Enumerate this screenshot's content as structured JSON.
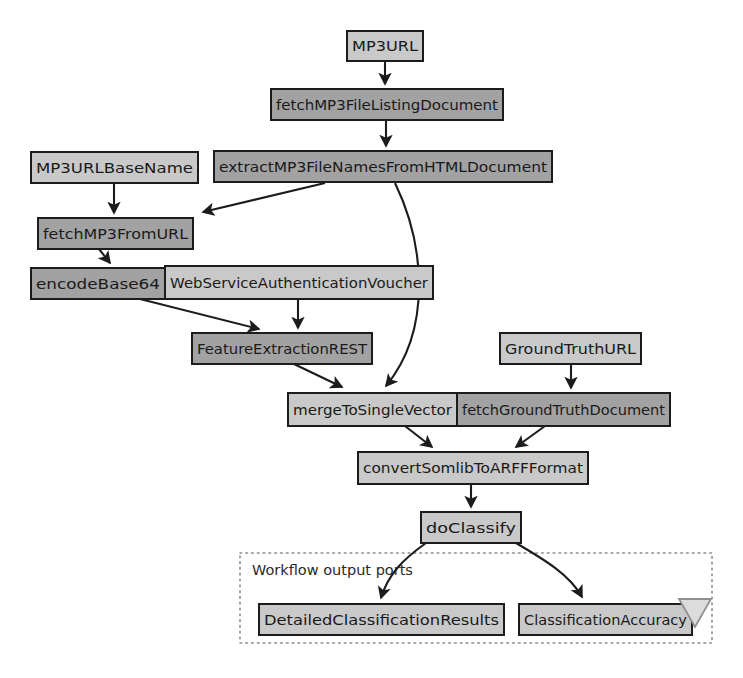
{
  "diagram": {
    "type": "workflow-dataflow-graph",
    "background_color": "#ffffff",
    "node_fill_light": "#c9c9c9",
    "node_fill_dark": "#a2a2a2",
    "node_stroke": "#1c1c1c",
    "edge_color": "#1c1c1c",
    "group_border_color": "#8a8a8a"
  },
  "nodes": [
    {
      "id": "mp3url",
      "label": "MP3URL",
      "shade": "light",
      "x": 347,
      "y": 31,
      "w": 76,
      "h": 30
    },
    {
      "id": "fetchMP3FileListingDocument",
      "label": "fetchMP3FileListingDocument",
      "shade": "dark",
      "x": 271,
      "y": 89,
      "w": 232,
      "h": 31
    },
    {
      "id": "mp3urlbasename",
      "label": "MP3URLBaseName",
      "shade": "light",
      "x": 31,
      "y": 152,
      "w": 167,
      "h": 31
    },
    {
      "id": "extractMP3FileNamesFromHTMLDocument",
      "label": "extractMP3FileNamesFromHTMLDocument",
      "shade": "dark",
      "x": 214,
      "y": 151,
      "w": 338,
      "h": 31
    },
    {
      "id": "fetchMP3FromURL",
      "label": "fetchMP3FromURL",
      "shade": "dark",
      "x": 38,
      "y": 218,
      "w": 155,
      "h": 31
    },
    {
      "id": "encodeBase64",
      "label": "encodeBase64",
      "shade": "dark",
      "x": 31,
      "y": 268,
      "w": 134,
      "h": 31
    },
    {
      "id": "WebServiceAuthenticationVoucher",
      "label": "WebServiceAuthenticationVoucher",
      "shade": "light",
      "x": 165,
      "y": 266,
      "w": 268,
      "h": 33
    },
    {
      "id": "FeatureExtractionREST",
      "label": "FeatureExtractionREST",
      "shade": "dark",
      "x": 192,
      "y": 333,
      "w": 180,
      "h": 31
    },
    {
      "id": "GroundTruthURL",
      "label": "GroundTruthURL",
      "shade": "light",
      "x": 500,
      "y": 333,
      "w": 141,
      "h": 31
    },
    {
      "id": "mergeToSingleVector",
      "label": "mergeToSingleVector",
      "shade": "light",
      "x": 288,
      "y": 393,
      "w": 169,
      "h": 33
    },
    {
      "id": "fetchGroundTruthDocument",
      "label": "fetchGroundTruthDocument",
      "shade": "dark",
      "x": 457,
      "y": 393,
      "w": 213,
      "h": 33
    },
    {
      "id": "convertSomlibToARFFFormat",
      "label": "convertSomlibToARFFFormat",
      "shade": "light",
      "x": 358,
      "y": 452,
      "w": 230,
      "h": 32
    },
    {
      "id": "doClassify",
      "label": "doClassify",
      "shade": "light",
      "x": 421,
      "y": 512,
      "w": 100,
      "h": 31
    },
    {
      "id": "DetailedClassificationResults",
      "label": "DetailedClassificationResults",
      "shade": "light",
      "x": 259,
      "y": 604,
      "w": 245,
      "h": 31
    },
    {
      "id": "ClassificationAccuracy",
      "label": "ClassificationAccuracy",
      "shade": "light",
      "x": 519,
      "y": 604,
      "w": 173,
      "h": 31
    }
  ],
  "group": {
    "id": "workflow-output-ports",
    "label": "Workflow output ports",
    "x": 240,
    "y": 553,
    "w": 472,
    "h": 90,
    "label_x": 252,
    "label_y": 571
  },
  "collapse_triangle": {
    "name": "collapse-triangle-icon",
    "x": 679,
    "y": 599,
    "w": 32,
    "h": 28
  },
  "edges": [
    {
      "from": "mp3url",
      "to": "fetchMP3FileListingDocument",
      "d": "M 385 61 L 385 84"
    },
    {
      "from": "fetchMP3FileListingDocument",
      "to": "extractMP3FileNamesFromHTMLDocument",
      "d": "M 386 120 L 386 146"
    },
    {
      "from": "mp3urlbasename",
      "to": "fetchMP3FromURL",
      "d": "M 114 183 L 114 213"
    },
    {
      "from": "extractMP3FileNamesFromHTMLDocument",
      "to": "fetchMP3FromURL",
      "d": "M 325 183 L 203 212"
    },
    {
      "from": "extractMP3FileNamesFromHTMLDocument",
      "to": "mergeToSingleVector",
      "d": "M 395 183 C 425 245, 432 330, 386 386"
    },
    {
      "from": "fetchMP3FromURL",
      "to": "encodeBase64",
      "d": "M 99 249 L 110 263"
    },
    {
      "from": "encodeBase64",
      "to": "FeatureExtractionREST",
      "d": "M 140 299 L 259 329"
    },
    {
      "from": "WebServiceAuthenticationVoucher",
      "to": "FeatureExtractionREST",
      "d": "M 298 299 L 298 328"
    },
    {
      "from": "FeatureExtractionREST",
      "to": "mergeToSingleVector",
      "d": "M 294 364 L 342 387"
    },
    {
      "from": "GroundTruthURL",
      "to": "fetchGroundTruthDocument",
      "d": "M 571 364 L 571 388"
    },
    {
      "from": "mergeToSingleVector",
      "to": "convertSomlibToARFFFormat",
      "d": "M 405 426 L 432 447"
    },
    {
      "from": "fetchGroundTruthDocument",
      "to": "convertSomlibToARFFFormat",
      "d": "M 545 426 L 516 447"
    },
    {
      "from": "convertSomlibToARFFFormat",
      "to": "doClassify",
      "d": "M 471 484 L 471 507"
    },
    {
      "from": "doClassify",
      "to": "DetailedClassificationResults",
      "d": "M 426 543 C 402 560, 388 575, 381 598"
    },
    {
      "from": "doClassify",
      "to": "ClassificationAccuracy",
      "d": "M 516 543 C 545 560, 570 575, 582 597"
    }
  ]
}
